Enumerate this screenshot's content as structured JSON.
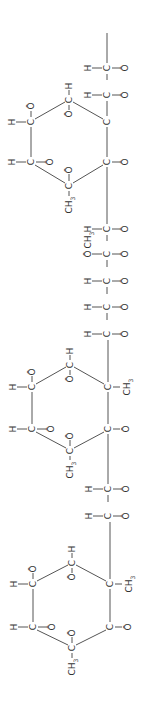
{
  "diagram": {
    "title": "",
    "colors": {
      "bond": "#555555",
      "text": "#333333",
      "background": "#ffffff"
    },
    "orientation": "rotated-90",
    "chain_top": {
      "rows": [
        {
          "left": "H",
          "center": "C",
          "right": "Ō"
        },
        {
          "left": "H",
          "center": "C",
          "right": "Ō"
        }
      ]
    },
    "ring1": {
      "top": {
        "atom": "C",
        "above": "H",
        "below": "Ō"
      },
      "left_upper": {
        "atom": "C",
        "left": "H",
        "above": "Ō"
      },
      "left_lower": {
        "atom": "C",
        "left": "H",
        "right": "Ō"
      },
      "bottom": {
        "atom": "C",
        "above": "Ō",
        "below": "CH",
        "below_sub": "3"
      },
      "right_lower": {
        "atom": "C",
        "right": "Ō"
      },
      "right_upper": {
        "atom": "C"
      }
    },
    "chain_middle": {
      "rows": [
        {
          "left": "H",
          "center": "C",
          "right": "Ō"
        },
        {
          "left": "Ō",
          "left_above": "CH",
          "left_above_sub": "3",
          "center": "C",
          "right": "Ō"
        },
        {
          "left": "H",
          "center": "C",
          "right": "Ō"
        },
        {
          "left": "H",
          "center": "C",
          "right": "Ō"
        },
        {
          "left": "H",
          "center": "C",
          "right": "Ō"
        }
      ]
    },
    "ring2": {
      "top": {
        "atom": "C",
        "above": "H",
        "below": "Ō"
      },
      "left_upper": {
        "atom": "C",
        "left": "H",
        "above": "Ō"
      },
      "left_lower": {
        "atom": "C",
        "left": "H",
        "right": "Ō"
      },
      "bottom": {
        "atom": "C",
        "above": "Ō",
        "below": "CH",
        "below_sub": "3"
      },
      "right_lower": {
        "atom": "C",
        "right": "Ō"
      },
      "right_upper": {
        "atom": "C",
        "right": "CH",
        "right_sub": "3"
      }
    },
    "chain_lower": {
      "rows": [
        {
          "left": "H",
          "center": "C",
          "right": "Ō"
        },
        {
          "left": "H",
          "center": "C",
          "right": "Ō"
        }
      ]
    },
    "ring3": {
      "top": {
        "atom": "C",
        "above": "H",
        "below": "Ō"
      },
      "left_upper": {
        "atom": "C",
        "left": "H",
        "above": "Ō"
      },
      "left_lower": {
        "atom": "C",
        "left": "H",
        "right": "Ō"
      },
      "bottom": {
        "atom": "C",
        "above": "Ō",
        "below": "CH",
        "below_sub": "3"
      },
      "right_lower": {
        "atom": "C",
        "right": "Ō"
      },
      "right_upper": {
        "atom": "C",
        "right": "CH",
        "right_sub": "3"
      }
    }
  }
}
